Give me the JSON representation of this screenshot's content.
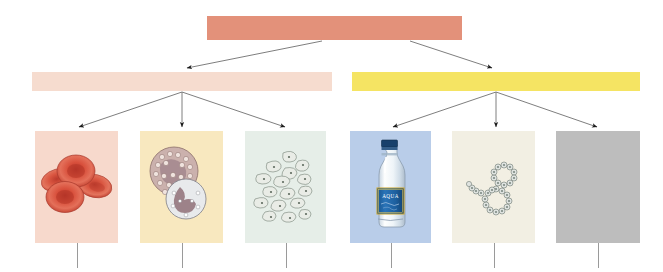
{
  "diagram": {
    "type": "hierarchy-tree",
    "background": "#ffffff",
    "levels": 3,
    "arrow_color": "#6a6a6a",
    "arrowhead_color": "#1a1a1a",
    "stem_color": "#9a9a9a"
  },
  "nodes": {
    "root": {
      "label": "",
      "name": "root-bar",
      "color": "#e3917a",
      "x": 207,
      "y": 16,
      "w": 255,
      "h": 24
    },
    "branches": [
      {
        "label": "",
        "name": "branch-bar-left",
        "color": "#f6dccf",
        "x": 32,
        "y": 72,
        "w": 300,
        "h": 19
      },
      {
        "label": "",
        "name": "branch-bar-right",
        "color": "#f5e463",
        "x": 352,
        "y": 72,
        "w": 288,
        "h": 19
      }
    ]
  },
  "panels": [
    {
      "name": "panel-red-blood-cells",
      "icon": "red-blood-cells-icon",
      "caption": "",
      "background": "#f7d9cc",
      "x": 35,
      "y": 131,
      "w": 83,
      "h": 112,
      "stem_height": 25
    },
    {
      "name": "panel-white-blood-cells",
      "icon": "white-blood-cells-icon",
      "caption": "",
      "background": "#f8e8bf",
      "x": 140,
      "y": 131,
      "w": 83,
      "h": 112,
      "stem_height": 25
    },
    {
      "name": "panel-platelets",
      "icon": "platelets-icon",
      "caption": "",
      "background": "#e6eee8",
      "x": 245,
      "y": 131,
      "w": 81,
      "h": 112,
      "stem_height": 25
    },
    {
      "name": "panel-water-bottle",
      "icon": "water-bottle-icon",
      "caption": "",
      "background": "#b9cde9",
      "x": 350,
      "y": 131,
      "w": 81,
      "h": 112,
      "stem_height": 25
    },
    {
      "name": "panel-protein-chain",
      "icon": "protein-chain-icon",
      "caption": "",
      "background": "#f2efe3",
      "x": 452,
      "y": 131,
      "w": 83,
      "h": 112,
      "stem_height": 25
    },
    {
      "name": "panel-blank-grey",
      "icon": "blank-grey-icon",
      "caption": "",
      "background": "#bdbdbd",
      "x": 556,
      "y": 131,
      "w": 84,
      "h": 112,
      "stem_height": 25
    }
  ],
  "labels": {
    "bottle_brand": "AQUA"
  },
  "arrows": [
    {
      "name": "arrow-root-to-left-branch",
      "from": [
        322,
        41
      ],
      "to": [
        186,
        69
      ]
    },
    {
      "name": "arrow-root-to-right-branch",
      "from": [
        410,
        41
      ],
      "to": [
        493,
        69
      ]
    },
    {
      "name": "arrow-left-branch-to-panel-1",
      "from": [
        182,
        92
      ],
      "to": [
        78,
        128
      ]
    },
    {
      "name": "arrow-left-branch-to-panel-2",
      "from": [
        182,
        92
      ],
      "to": [
        182,
        128
      ]
    },
    {
      "name": "arrow-left-branch-to-panel-3",
      "from": [
        182,
        92
      ],
      "to": [
        286,
        128
      ]
    },
    {
      "name": "arrow-right-branch-to-panel-4",
      "from": [
        496,
        92
      ],
      "to": [
        392,
        128
      ]
    },
    {
      "name": "arrow-right-branch-to-panel-5",
      "from": [
        496,
        92
      ],
      "to": [
        496,
        128
      ]
    },
    {
      "name": "arrow-right-branch-to-panel-6",
      "from": [
        496,
        92
      ],
      "to": [
        598,
        128
      ]
    }
  ]
}
